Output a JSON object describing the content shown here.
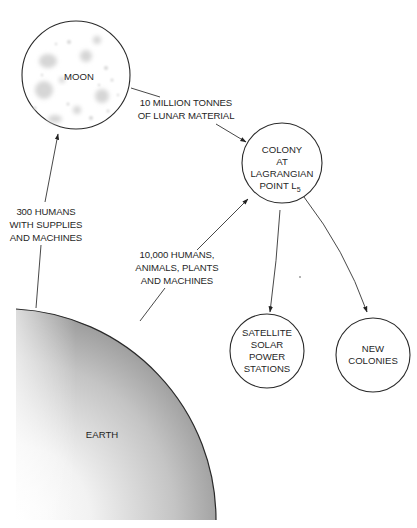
{
  "diagram": {
    "nodes": {
      "moon": {
        "label": "MOON"
      },
      "colony": {
        "lines": [
          "COLONY",
          "AT",
          "LAGRANGIAN",
          "POINT L"
        ],
        "subscript": "5"
      },
      "satellite": {
        "lines": [
          "SATELLITE",
          "SOLAR",
          "POWER",
          "STATIONS"
        ]
      },
      "new_colonies": {
        "lines": [
          "NEW",
          "COLONIES"
        ]
      },
      "earth": {
        "label": "EARTH"
      }
    },
    "edges": {
      "earth_to_moon": {
        "lines": [
          "300 HUMANS",
          "WITH SUPPLIES",
          "AND MACHINES"
        ]
      },
      "moon_to_colony": {
        "lines": [
          "10 MILLION TONNES",
          "OF LUNAR MATERIAL"
        ]
      },
      "earth_to_colony": {
        "lines": [
          "10,000 HUMANS,",
          "ANIMALS, PLANTS",
          "AND MACHINES"
        ]
      }
    },
    "colors": {
      "stroke": "#2a2a2a",
      "crater": "#d4d4d4",
      "earth_light": "#ffffff",
      "earth_dark": "#9a9a9a"
    }
  }
}
